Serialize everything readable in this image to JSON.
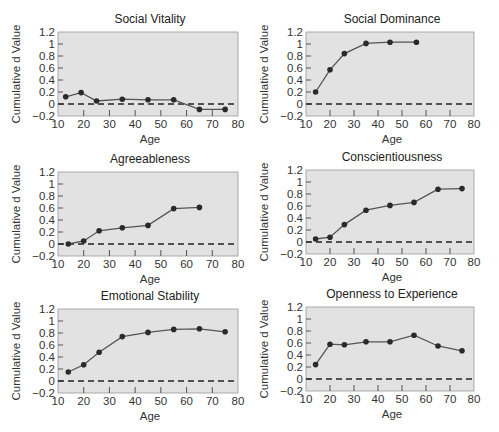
{
  "figure": {
    "background": "#ffffff",
    "plot_background": "#e2e2e2",
    "line_color": "#555555",
    "marker_color": "#2a2a2a",
    "zero_line_color": "#222222"
  },
  "chart_data": [
    {
      "type": "line",
      "title": "Social Vitality",
      "xlabel": "Age",
      "ylabel": "Cumulative d Value",
      "xlim": [
        10,
        80
      ],
      "ylim": [
        -0.2,
        1.2
      ],
      "xticks": [
        "10",
        "20",
        "30",
        "40",
        "50",
        "60",
        "70",
        "80"
      ],
      "yticks": [
        "−0.2",
        "0",
        "0.2",
        "0.4",
        "0.6",
        "0.8",
        "1",
        "1.2"
      ],
      "reference_line": {
        "y": 0,
        "style": "dashed"
      },
      "x": [
        13,
        19,
        25,
        35,
        45,
        55,
        65,
        75
      ],
      "values": [
        0.12,
        0.19,
        0.05,
        0.08,
        0.07,
        0.07,
        -0.09,
        -0.09
      ]
    },
    {
      "type": "line",
      "title": "Social Dominance",
      "xlabel": "Age",
      "ylabel": "Cumulative d Value",
      "xlim": [
        10,
        80
      ],
      "ylim": [
        -0.2,
        1.2
      ],
      "xticks": [
        "10",
        "20",
        "30",
        "40",
        "50",
        "60",
        "70",
        "80"
      ],
      "yticks": [
        "−0.2",
        "0",
        "0.2",
        "0.4",
        "0.6",
        "0.8",
        "1",
        "1.2"
      ],
      "reference_line": {
        "y": 0,
        "style": "dashed"
      },
      "x": [
        14,
        20,
        26,
        35,
        45,
        56
      ],
      "values": [
        0.2,
        0.57,
        0.84,
        1.01,
        1.03,
        1.03
      ]
    },
    {
      "type": "line",
      "title": "Agreeableness",
      "xlabel": "Age",
      "ylabel": "Cumulative d Value",
      "xlim": [
        10,
        80
      ],
      "ylim": [
        -0.2,
        1.2
      ],
      "xticks": [
        "10",
        "20",
        "30",
        "40",
        "50",
        "60",
        "70",
        "80"
      ],
      "yticks": [
        "−0.2",
        "0",
        "0.2",
        "0.4",
        "0.6",
        "0.8",
        "1",
        "1.2"
      ],
      "reference_line": {
        "y": 0,
        "style": "dashed"
      },
      "x": [
        14,
        20,
        26,
        35,
        45,
        55,
        65
      ],
      "values": [
        0.0,
        0.05,
        0.22,
        0.27,
        0.31,
        0.59,
        0.61
      ]
    },
    {
      "type": "line",
      "title": "Conscientiousness",
      "xlabel": "Age",
      "ylabel": "Cumulative d Value",
      "xlim": [
        10,
        80
      ],
      "ylim": [
        -0.2,
        1.2
      ],
      "xticks": [
        "10",
        "20",
        "30",
        "40",
        "50",
        "60",
        "70",
        "80"
      ],
      "yticks": [
        "−0.2",
        "0",
        "0.2",
        "0.4",
        "0.6",
        "0.8",
        "1",
        "1.2"
      ],
      "reference_line": {
        "y": 0,
        "style": "dashed"
      },
      "x": [
        14,
        20,
        26,
        35,
        45,
        55,
        65,
        75
      ],
      "values": [
        0.05,
        0.08,
        0.29,
        0.53,
        0.61,
        0.66,
        0.88,
        0.89
      ]
    },
    {
      "type": "line",
      "title": "Emotional Stability",
      "xlabel": "Age",
      "ylabel": "Cumulative d Value",
      "xlim": [
        10,
        80
      ],
      "ylim": [
        -0.2,
        1.2
      ],
      "xticks": [
        "10",
        "20",
        "30",
        "40",
        "50",
        "60",
        "70",
        "80"
      ],
      "yticks": [
        "−0.2",
        "0",
        "0.2",
        "0.4",
        "0.6",
        "0.8",
        "1",
        "1.2"
      ],
      "reference_line": {
        "y": 0,
        "style": "dashed"
      },
      "x": [
        14,
        20,
        26,
        35,
        45,
        55,
        65,
        75
      ],
      "values": [
        0.15,
        0.27,
        0.48,
        0.74,
        0.81,
        0.86,
        0.87,
        0.82
      ]
    },
    {
      "type": "line",
      "title": "Openness to Experience",
      "xlabel": "Age",
      "ylabel": "Cumulative d Value",
      "xlim": [
        10,
        80
      ],
      "ylim": [
        -0.2,
        1.2
      ],
      "xticks": [
        "10",
        "20",
        "30",
        "40",
        "50",
        "60",
        "70",
        "80"
      ],
      "yticks": [
        "−0.2",
        "0",
        "0.2",
        "0.4",
        "0.6",
        "0.8",
        "1",
        "1.2"
      ],
      "reference_line": {
        "y": 0,
        "style": "dashed"
      },
      "x": [
        14,
        20,
        26,
        35,
        45,
        55,
        65,
        75
      ],
      "values": [
        0.24,
        0.58,
        0.57,
        0.62,
        0.62,
        0.73,
        0.55,
        0.47
      ]
    }
  ]
}
